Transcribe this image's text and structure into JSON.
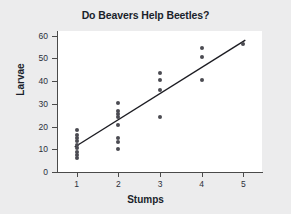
{
  "chart_data": {
    "type": "scatter",
    "title": "Do Beavers Help Beetles?",
    "xlabel": "Stumps",
    "ylabel": "Larvae",
    "xlim": [
      0.55,
      5.45
    ],
    "ylim": [
      0,
      62
    ],
    "xticks": [
      1,
      2,
      3,
      4,
      5
    ],
    "xtick_labels": [
      "1",
      "2",
      "3",
      "4",
      "5"
    ],
    "yticks": [
      0,
      10,
      20,
      30,
      40,
      50,
      60
    ],
    "ytick_labels": [
      "0",
      "10",
      "20",
      "30",
      "40",
      "50",
      "60"
    ],
    "grid": false,
    "legend": false,
    "marker_color": "#4b4b52",
    "line_color": "#1c1c22",
    "panel_color": "#ffffff",
    "background_color": "#ececed",
    "points": [
      {
        "x": 1,
        "y": 18.5
      },
      {
        "x": 1,
        "y": 16.5
      },
      {
        "x": 1,
        "y": 15.0
      },
      {
        "x": 1,
        "y": 13.5
      },
      {
        "x": 1,
        "y": 12.0
      },
      {
        "x": 1,
        "y": 10.5
      },
      {
        "x": 1,
        "y": 9.0
      },
      {
        "x": 1,
        "y": 7.5
      },
      {
        "x": 1,
        "y": 6.0
      },
      {
        "x": 2,
        "y": 30.5
      },
      {
        "x": 2,
        "y": 27.0
      },
      {
        "x": 2,
        "y": 25.5
      },
      {
        "x": 2,
        "y": 24.0
      },
      {
        "x": 2,
        "y": 20.5
      },
      {
        "x": 2,
        "y": 15.0
      },
      {
        "x": 2,
        "y": 13.0
      },
      {
        "x": 2,
        "y": 10.0
      },
      {
        "x": 3,
        "y": 43.5
      },
      {
        "x": 3,
        "y": 40.5
      },
      {
        "x": 3,
        "y": 36.0
      },
      {
        "x": 3,
        "y": 24.0
      },
      {
        "x": 4,
        "y": 54.5
      },
      {
        "x": 4,
        "y": 50.5
      },
      {
        "x": 4,
        "y": 40.5
      },
      {
        "x": 5,
        "y": 56.5
      }
    ],
    "fit_line": {
      "label": "fitted regression line",
      "x_start": 0.95,
      "y_start": 11.0,
      "x_end": 5.05,
      "y_end": 58.0
    }
  }
}
